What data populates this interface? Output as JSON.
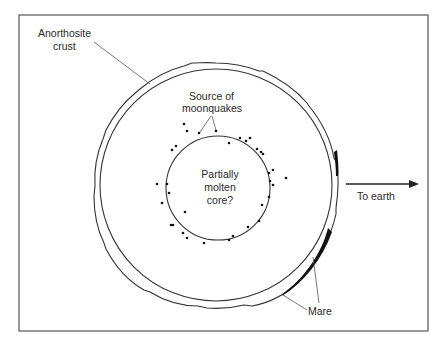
{
  "figure": {
    "type": "cross-section diagram of the Moon",
    "colors": {
      "background": "#ffffff",
      "line": "#333333",
      "frame": "#555555",
      "text": "#2a2a2a",
      "mare_fill": "#111111"
    }
  },
  "labels": {
    "crust_line1": "Anorthosite",
    "crust_line2": "crust",
    "source_line1": "Source of",
    "source_line2": "moonquakes",
    "core_line1": "Partially",
    "core_line2": "molten",
    "core_line3": "core?",
    "earth_direction": "To earth",
    "mare": "Mare"
  },
  "geometry": {
    "outer_crust_circle": {
      "cx": 216,
      "cy": 185,
      "r": 122
    },
    "inner_crust_circle": {
      "cx": 216,
      "cy": 185,
      "r": 116
    },
    "core_circle": {
      "cx": 218,
      "cy": 188,
      "r": 52
    }
  },
  "moonquake_sources": [
    [
      199,
      133
    ],
    [
      216,
      131
    ],
    [
      184,
      124
    ],
    [
      187,
      131
    ],
    [
      172,
      150
    ],
    [
      176,
      146
    ],
    [
      229,
      143
    ],
    [
      240,
      138
    ],
    [
      246,
      141
    ],
    [
      250,
      138
    ],
    [
      257,
      149
    ],
    [
      261,
      152
    ],
    [
      263,
      154
    ],
    [
      269,
      173
    ],
    [
      273,
      170
    ],
    [
      286,
      178
    ],
    [
      270,
      181
    ],
    [
      273,
      185
    ],
    [
      269,
      197
    ],
    [
      157,
      184
    ],
    [
      167,
      184
    ],
    [
      169,
      193
    ],
    [
      162,
      203
    ],
    [
      185,
      212
    ],
    [
      171,
      225
    ],
    [
      173,
      225
    ],
    [
      183,
      233
    ],
    [
      187,
      238
    ],
    [
      204,
      243
    ],
    [
      229,
      240
    ],
    [
      233,
      236
    ],
    [
      248,
      227
    ],
    [
      259,
      221
    ],
    [
      262,
      205
    ]
  ]
}
